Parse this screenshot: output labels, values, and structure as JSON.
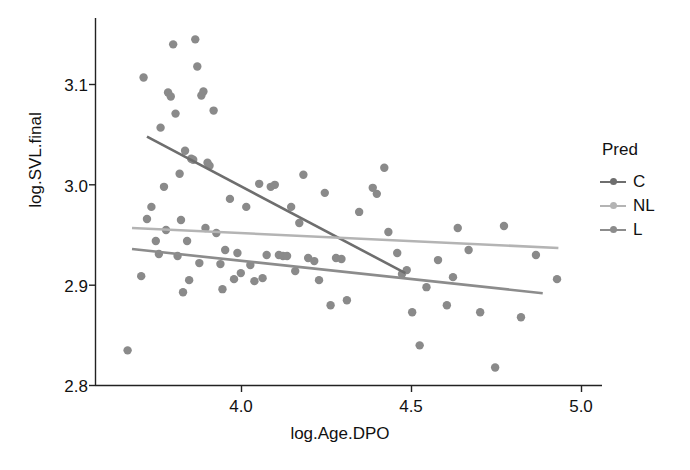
{
  "chart_data": {
    "type": "scatter",
    "title": "",
    "xlabel": "log.Age.DPO",
    "ylabel": "log.SVL.final",
    "xlim": [
      3.63,
      5.05
    ],
    "ylim": [
      2.785,
      3.165
    ],
    "xticks": [
      "4.0",
      "4.5",
      "5.0"
    ],
    "xtick_values": [
      4.0,
      4.5,
      5.0
    ],
    "yticks": [
      "2.8",
      "2.9",
      "3.0",
      "3.1"
    ],
    "ytick_values": [
      2.8,
      2.9,
      3.0,
      3.1
    ],
    "grid": false,
    "legend": {
      "title": "Pred",
      "position": "right",
      "entries": [
        {
          "label": "C",
          "color": "#6e6e6e"
        },
        {
          "label": "NL",
          "color": "#b4b4b4"
        },
        {
          "label": "L",
          "color": "#8c8c8c"
        }
      ]
    },
    "point_color": "#8a8a8a",
    "point_radius": 4.2,
    "points": [
      {
        "x": 3.665,
        "y": 2.835
      },
      {
        "x": 3.705,
        "y": 2.909
      },
      {
        "x": 3.712,
        "y": 3.107
      },
      {
        "x": 3.722,
        "y": 2.966
      },
      {
        "x": 3.735,
        "y": 2.978
      },
      {
        "x": 3.748,
        "y": 2.944
      },
      {
        "x": 3.757,
        "y": 2.931
      },
      {
        "x": 3.762,
        "y": 3.057
      },
      {
        "x": 3.772,
        "y": 2.998
      },
      {
        "x": 3.778,
        "y": 2.955
      },
      {
        "x": 3.784,
        "y": 3.092
      },
      {
        "x": 3.792,
        "y": 3.088
      },
      {
        "x": 3.799,
        "y": 3.14
      },
      {
        "x": 3.806,
        "y": 3.071
      },
      {
        "x": 3.812,
        "y": 2.929
      },
      {
        "x": 3.818,
        "y": 3.011
      },
      {
        "x": 3.822,
        "y": 2.965
      },
      {
        "x": 3.828,
        "y": 2.893
      },
      {
        "x": 3.834,
        "y": 3.034
      },
      {
        "x": 3.84,
        "y": 2.944
      },
      {
        "x": 3.846,
        "y": 2.905
      },
      {
        "x": 3.852,
        "y": 3.026
      },
      {
        "x": 3.858,
        "y": 3.025
      },
      {
        "x": 3.864,
        "y": 3.145
      },
      {
        "x": 3.87,
        "y": 3.118
      },
      {
        "x": 3.876,
        "y": 2.922
      },
      {
        "x": 3.882,
        "y": 3.089
      },
      {
        "x": 3.888,
        "y": 3.093
      },
      {
        "x": 3.894,
        "y": 2.957
      },
      {
        "x": 3.9,
        "y": 3.022
      },
      {
        "x": 3.906,
        "y": 3.019
      },
      {
        "x": 3.918,
        "y": 3.074
      },
      {
        "x": 3.926,
        "y": 2.952
      },
      {
        "x": 3.938,
        "y": 2.921
      },
      {
        "x": 3.944,
        "y": 2.896
      },
      {
        "x": 3.952,
        "y": 2.935
      },
      {
        "x": 3.966,
        "y": 2.986
      },
      {
        "x": 3.978,
        "y": 2.906
      },
      {
        "x": 3.988,
        "y": 2.932
      },
      {
        "x": 3.998,
        "y": 2.912
      },
      {
        "x": 4.014,
        "y": 2.978
      },
      {
        "x": 4.026,
        "y": 2.92
      },
      {
        "x": 4.038,
        "y": 2.904
      },
      {
        "x": 4.052,
        "y": 3.001
      },
      {
        "x": 4.062,
        "y": 2.907
      },
      {
        "x": 4.074,
        "y": 2.93
      },
      {
        "x": 4.086,
        "y": 2.998
      },
      {
        "x": 4.098,
        "y": 3.0
      },
      {
        "x": 4.11,
        "y": 2.93
      },
      {
        "x": 4.122,
        "y": 2.929
      },
      {
        "x": 4.134,
        "y": 2.929
      },
      {
        "x": 4.146,
        "y": 2.978
      },
      {
        "x": 4.158,
        "y": 2.914
      },
      {
        "x": 4.17,
        "y": 2.962
      },
      {
        "x": 4.182,
        "y": 3.01
      },
      {
        "x": 4.196,
        "y": 2.927
      },
      {
        "x": 4.214,
        "y": 2.924
      },
      {
        "x": 4.228,
        "y": 2.905
      },
      {
        "x": 4.245,
        "y": 2.992
      },
      {
        "x": 4.262,
        "y": 2.88
      },
      {
        "x": 4.278,
        "y": 2.927
      },
      {
        "x": 4.294,
        "y": 2.926
      },
      {
        "x": 4.31,
        "y": 2.885
      },
      {
        "x": 4.346,
        "y": 2.973
      },
      {
        "x": 4.386,
        "y": 2.997
      },
      {
        "x": 4.398,
        "y": 2.991
      },
      {
        "x": 4.42,
        "y": 3.017
      },
      {
        "x": 4.432,
        "y": 2.953
      },
      {
        "x": 4.458,
        "y": 2.932
      },
      {
        "x": 4.472,
        "y": 2.911
      },
      {
        "x": 4.486,
        "y": 2.915
      },
      {
        "x": 4.502,
        "y": 2.873
      },
      {
        "x": 4.524,
        "y": 2.84
      },
      {
        "x": 4.544,
        "y": 2.898
      },
      {
        "x": 4.578,
        "y": 2.925
      },
      {
        "x": 4.604,
        "y": 2.88
      },
      {
        "x": 4.622,
        "y": 2.908
      },
      {
        "x": 4.636,
        "y": 2.957
      },
      {
        "x": 4.668,
        "y": 2.935
      },
      {
        "x": 4.702,
        "y": 2.873
      },
      {
        "x": 4.746,
        "y": 2.818
      },
      {
        "x": 4.772,
        "y": 2.959
      },
      {
        "x": 4.822,
        "y": 2.868
      },
      {
        "x": 4.866,
        "y": 2.93
      },
      {
        "x": 4.928,
        "y": 2.906
      }
    ],
    "series": [
      {
        "name": "C",
        "type": "regression-line",
        "color": "#6e6e6e",
        "x_start": 3.722,
        "y_start": 3.048,
        "x_end": 4.482,
        "y_end": 2.912
      },
      {
        "name": "NL",
        "type": "regression-line",
        "color": "#b4b4b4",
        "x_start": 3.678,
        "y_start": 2.957,
        "x_end": 4.932,
        "y_end": 2.937
      },
      {
        "name": "L",
        "type": "regression-line",
        "color": "#8c8c8c",
        "x_start": 3.678,
        "y_start": 2.936,
        "x_end": 4.886,
        "y_end": 2.892
      }
    ]
  }
}
